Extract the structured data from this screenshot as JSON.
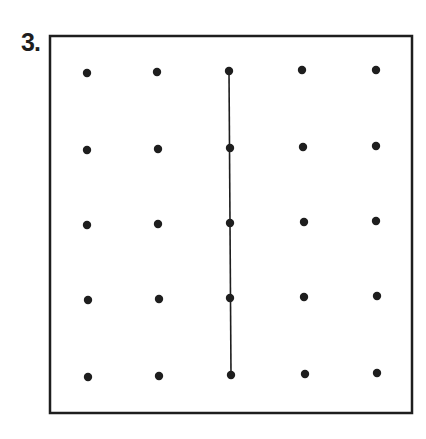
{
  "problem": {
    "label": "3."
  },
  "board": {
    "frame": {
      "left": 50,
      "top": 36,
      "right": 412,
      "bottom": 413,
      "stroke": "#1e1e1e",
      "stroke_width": 2.5
    },
    "dot_color": "#1e1e1e",
    "dot_radius": 4.2,
    "grid": {
      "rows": 5,
      "cols": 5,
      "dots": [
        [
          [
            87,
            73
          ],
          [
            157,
            72
          ],
          [
            229,
            71
          ],
          [
            302,
            70
          ],
          [
            376,
            70
          ]
        ],
        [
          [
            87,
            150
          ],
          [
            158,
            149
          ],
          [
            230,
            148
          ],
          [
            303,
            147
          ],
          [
            376,
            146
          ]
        ],
        [
          [
            87,
            225
          ],
          [
            158,
            224
          ],
          [
            230,
            223
          ],
          [
            304,
            222
          ],
          [
            376,
            221
          ]
        ],
        [
          [
            88,
            300
          ],
          [
            159,
            299
          ],
          [
            230,
            298
          ],
          [
            304,
            297
          ],
          [
            377,
            296
          ]
        ],
        [
          [
            88,
            377
          ],
          [
            159,
            376
          ],
          [
            231,
            375
          ],
          [
            305,
            374
          ],
          [
            377,
            373
          ]
        ]
      ]
    },
    "segment": {
      "from": {
        "row": 0,
        "col": 2
      },
      "to": {
        "row": 4,
        "col": 2
      },
      "color": "#1e1e1e",
      "width": 1.6
    }
  }
}
